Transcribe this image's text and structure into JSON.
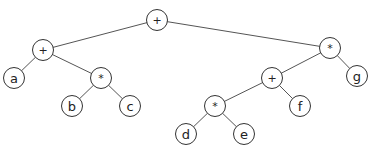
{
  "diagram": {
    "type": "expression-tree",
    "node_radius": 11,
    "line_color": "#555555",
    "nodes": [
      {
        "id": "n0",
        "label": "+",
        "kind": "op",
        "x": 157,
        "y": 20
      },
      {
        "id": "n1",
        "label": "+",
        "kind": "op",
        "x": 43,
        "y": 50
      },
      {
        "id": "n2",
        "label": "a",
        "kind": "leaf",
        "x": 14,
        "y": 78
      },
      {
        "id": "n3",
        "label": "*",
        "kind": "op",
        "x": 101,
        "y": 78
      },
      {
        "id": "n4",
        "label": "b",
        "kind": "leaf",
        "x": 72,
        "y": 106
      },
      {
        "id": "n5",
        "label": "c",
        "kind": "leaf",
        "x": 130,
        "y": 106
      },
      {
        "id": "n6",
        "label": "*",
        "kind": "op",
        "x": 330,
        "y": 48
      },
      {
        "id": "n7",
        "label": "g",
        "kind": "leaf",
        "x": 357,
        "y": 76
      },
      {
        "id": "n8",
        "label": "+",
        "kind": "op",
        "x": 272,
        "y": 78
      },
      {
        "id": "n9",
        "label": "f",
        "kind": "leaf",
        "x": 300,
        "y": 106
      },
      {
        "id": "n10",
        "label": "*",
        "kind": "op",
        "x": 215,
        "y": 106
      },
      {
        "id": "n11",
        "label": "d",
        "kind": "leaf",
        "x": 186,
        "y": 134
      },
      {
        "id": "n12",
        "label": "e",
        "kind": "leaf",
        "x": 244,
        "y": 134
      }
    ],
    "edges": [
      [
        "n0",
        "n1"
      ],
      [
        "n0",
        "n6"
      ],
      [
        "n1",
        "n2"
      ],
      [
        "n1",
        "n3"
      ],
      [
        "n3",
        "n4"
      ],
      [
        "n3",
        "n5"
      ],
      [
        "n6",
        "n8"
      ],
      [
        "n6",
        "n7"
      ],
      [
        "n8",
        "n10"
      ],
      [
        "n8",
        "n9"
      ],
      [
        "n10",
        "n11"
      ],
      [
        "n10",
        "n12"
      ]
    ]
  }
}
